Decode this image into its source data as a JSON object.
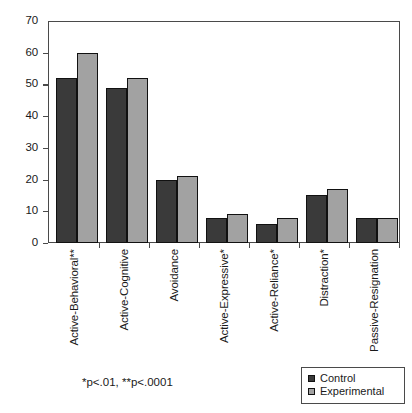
{
  "chart_data": {
    "type": "bar",
    "title": "",
    "subtitle": "",
    "xlabel": "",
    "ylabel": "",
    "ylim": [
      0,
      70
    ],
    "ytick_step": 10,
    "yticks": [
      "70",
      "60",
      "50",
      "40",
      "30",
      "20",
      "10",
      "0"
    ],
    "grid": false,
    "legend_position": "bottom-right",
    "categories": [
      "Active-Behavioral**",
      "Active-Cognitive",
      "Avoidance",
      "Active-Expressive*",
      "Active-Reliance*",
      "Distraction*",
      "Passive-Resignation"
    ],
    "series": [
      {
        "name": "Control",
        "color": "#3a3a3a",
        "values": [
          52,
          49,
          20,
          8,
          6,
          15,
          8
        ]
      },
      {
        "name": "Experimental",
        "color": "#a2a2a2",
        "values": [
          60,
          52,
          21,
          9,
          8,
          17,
          8
        ]
      }
    ],
    "annotations": {
      "significance_note": "*p<.01,  **p<.0001"
    }
  },
  "legend": {
    "items": [
      {
        "label": "Control",
        "color": "#3a3a3a"
      },
      {
        "label": "Experimental",
        "color": "#a2a2a2"
      }
    ]
  },
  "footnote": {
    "text": "*p<.01,  **p<.0001"
  },
  "colors": {
    "control": "#3a3a3a",
    "experimental": "#a2a2a2",
    "axis": "#4a4a4a",
    "background": "#ffffff",
    "text": "#1a1a1a"
  }
}
